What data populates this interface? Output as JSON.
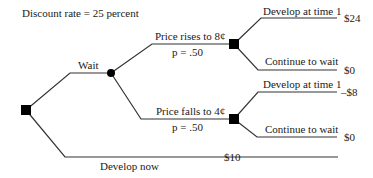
{
  "diagram": {
    "type": "decision-tree",
    "header": "Discount rate = 25 percent",
    "nodes": {
      "root": {
        "kind": "decision",
        "shape": "square"
      },
      "wait_chance": {
        "kind": "chance",
        "shape": "circle"
      },
      "rise_decision": {
        "kind": "decision",
        "shape": "square"
      },
      "fall_decision": {
        "kind": "decision",
        "shape": "square"
      }
    },
    "branches": {
      "wait": {
        "label": "Wait"
      },
      "price_rises": {
        "label": "Price rises to 8¢",
        "probability": "p = .50"
      },
      "price_falls": {
        "label": "Price falls to 4¢",
        "probability": "p = .50"
      },
      "rise_develop": {
        "label": "Develop at time 1",
        "payoff": "$24"
      },
      "rise_continue": {
        "label": "Continue to wait",
        "payoff": "$0"
      },
      "fall_develop": {
        "label": "Develop at time 1",
        "payoff": "–$8"
      },
      "fall_continue": {
        "label": "Continue to wait",
        "payoff": "$0"
      },
      "develop_now": {
        "label": "Develop now",
        "payoff": "$10"
      }
    },
    "colors": {
      "line": "#333333",
      "node": "#000000",
      "text": "#1a1a1a"
    }
  }
}
